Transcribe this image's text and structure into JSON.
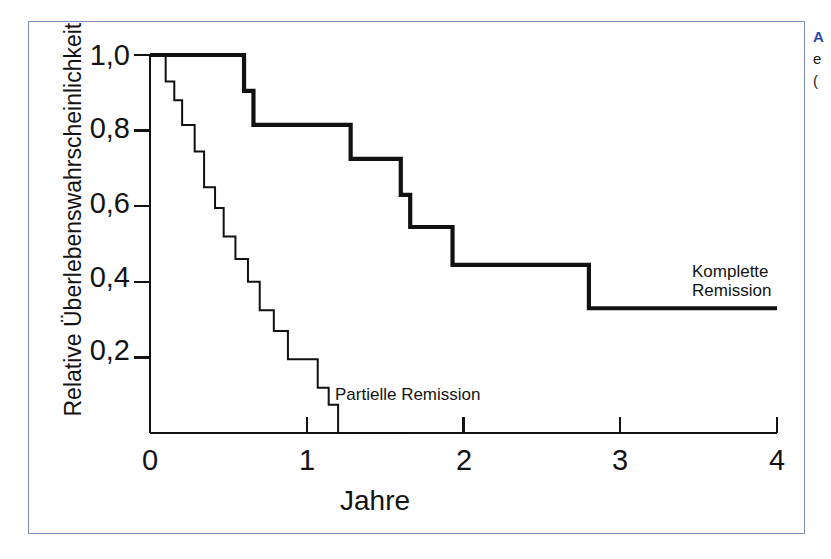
{
  "figure": {
    "frame_color": "#7f8cc4",
    "background": "#ffffff"
  },
  "caption": {
    "head": "A",
    "line2": "e",
    "line3": "("
  },
  "chart_data": {
    "type": "line",
    "title": "",
    "subtitle": "",
    "xlabel": "Jahre",
    "ylabel": "Relative Überlebenswahrscheinlichkeit",
    "xlim": [
      0,
      4
    ],
    "ylim": [
      0,
      1.0
    ],
    "xticks": [
      0,
      1,
      2,
      3,
      4
    ],
    "xtick_labels": [
      "0",
      "1",
      "2",
      "3",
      "4"
    ],
    "yticks": [
      0.2,
      0.4,
      0.6,
      0.8,
      1.0
    ],
    "ytick_labels": [
      "0,2",
      "0,4",
      "0,6",
      "0,8",
      "1,0"
    ],
    "grid": false,
    "legend": "in-plot annotations",
    "series": [
      {
        "name": "Komplette Remission",
        "style": "step-post",
        "linewidth": "thick",
        "color": "#111111",
        "annotation_lines": [
          "Komplette",
          "Remission"
        ],
        "x": [
          0.0,
          0.6,
          0.6,
          0.66,
          0.66,
          1.28,
          1.28,
          1.6,
          1.6,
          1.66,
          1.66,
          1.93,
          1.93,
          2.8,
          2.8,
          4.0
        ],
        "y": [
          1.0,
          1.0,
          0.905,
          0.905,
          0.815,
          0.815,
          0.725,
          0.725,
          0.63,
          0.63,
          0.545,
          0.545,
          0.445,
          0.445,
          0.33,
          0.33
        ],
        "steps": [
          {
            "time": 0.0,
            "survival": 1.0
          },
          {
            "time": 0.6,
            "survival": 0.905
          },
          {
            "time": 0.66,
            "survival": 0.815
          },
          {
            "time": 1.28,
            "survival": 0.725
          },
          {
            "time": 1.6,
            "survival": 0.63
          },
          {
            "time": 1.66,
            "survival": 0.545
          },
          {
            "time": 1.93,
            "survival": 0.445
          },
          {
            "time": 2.8,
            "survival": 0.33
          },
          {
            "time": 4.0,
            "survival": 0.33
          }
        ]
      },
      {
        "name": "Partielle Remission",
        "style": "step-post",
        "linewidth": "thin",
        "color": "#111111",
        "annotation_lines": [
          "Partielle Remission"
        ],
        "x": [
          0.0,
          0.1,
          0.1,
          0.155,
          0.155,
          0.205,
          0.205,
          0.285,
          0.285,
          0.345,
          0.345,
          0.415,
          0.415,
          0.47,
          0.47,
          0.545,
          0.545,
          0.625,
          0.625,
          0.7,
          0.7,
          0.79,
          0.79,
          0.88,
          0.88,
          0.975,
          0.975,
          1.07,
          1.07,
          1.14,
          1.14,
          1.2,
          1.2,
          1.64
        ],
        "y": [
          1.0,
          1.0,
          0.93,
          0.93,
          0.88,
          0.88,
          0.815,
          0.815,
          0.745,
          0.745,
          0.65,
          0.65,
          0.595,
          0.595,
          0.52,
          0.52,
          0.46,
          0.46,
          0.4,
          0.4,
          0.325,
          0.325,
          0.27,
          0.27,
          0.195,
          0.195,
          0.195,
          0.195,
          0.12,
          0.12,
          0.075,
          0.075,
          0.0,
          0.0
        ],
        "steps": [
          {
            "time": 0.0,
            "survival": 1.0
          },
          {
            "time": 0.1,
            "survival": 0.93
          },
          {
            "time": 0.155,
            "survival": 0.88
          },
          {
            "time": 0.205,
            "survival": 0.815
          },
          {
            "time": 0.285,
            "survival": 0.745
          },
          {
            "time": 0.345,
            "survival": 0.65
          },
          {
            "time": 0.415,
            "survival": 0.595
          },
          {
            "time": 0.47,
            "survival": 0.52
          },
          {
            "time": 0.545,
            "survival": 0.46
          },
          {
            "time": 0.625,
            "survival": 0.4
          },
          {
            "time": 0.7,
            "survival": 0.325
          },
          {
            "time": 0.79,
            "survival": 0.27
          },
          {
            "time": 0.88,
            "survival": 0.195
          },
          {
            "time": 1.07,
            "survival": 0.12
          },
          {
            "time": 1.14,
            "survival": 0.075
          },
          {
            "time": 1.2,
            "survival": 0.0
          },
          {
            "time": 1.64,
            "survival": 0.0
          }
        ]
      }
    ]
  }
}
